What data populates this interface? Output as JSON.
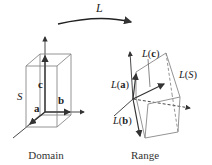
{
  "diagram": {
    "transform_label": "L",
    "domain": {
      "caption": "Domain",
      "set_label": "S",
      "vectors": [
        "a",
        "b",
        "c"
      ]
    },
    "range": {
      "caption": "Range",
      "set_label": "L(S)",
      "vector_labels": [
        "L(a)",
        "L(b)",
        "L(c)"
      ]
    },
    "colors": {
      "stroke": "#555555",
      "box": "#777777",
      "text": "#222222"
    }
  }
}
